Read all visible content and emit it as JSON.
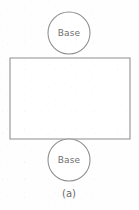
{
  "figure": {
    "caption": "(a)",
    "background_color": "#fefefe",
    "stroke_color": "#8d8d8d",
    "text_color": "#6e6e6e",
    "top_circle": {
      "label": "Base",
      "cx": 69,
      "cy": 33,
      "r": 21
    },
    "bottom_circle": {
      "label": "Base",
      "cx": 69,
      "cy": 160,
      "r": 21
    },
    "rectangle": {
      "x": 10,
      "y": 58,
      "width": 120,
      "height": 81
    },
    "caption_position": {
      "x": 69,
      "y": 193
    }
  }
}
